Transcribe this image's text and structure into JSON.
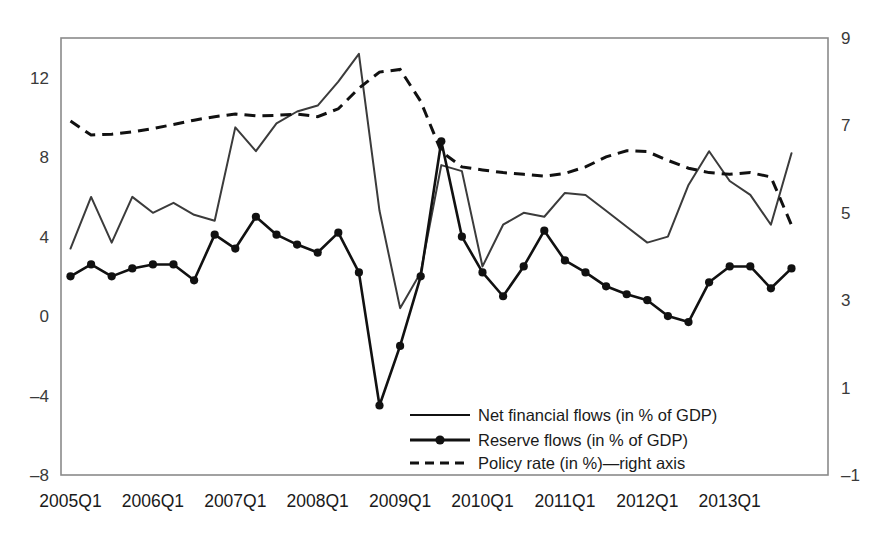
{
  "chart_data": {
    "type": "line",
    "title": "",
    "subtitle": "",
    "xlabel": "",
    "ylabel": "",
    "y2label": "",
    "grid": false,
    "legend_position": "bottom-right-inside",
    "xlim": [
      "2005Q1",
      "2013Q4"
    ],
    "ylim": [
      -8,
      14
    ],
    "y2lim": [
      -1,
      9
    ],
    "yticks": [
      12,
      8,
      4,
      0,
      -4,
      -8
    ],
    "ytick_labels": [
      "12",
      "8",
      "4",
      "0",
      "–4",
      "–8"
    ],
    "y2ticks": [
      9,
      7,
      5,
      3,
      1,
      -1
    ],
    "y2tick_labels": [
      "9",
      "7",
      "5",
      "3",
      "1",
      "–1"
    ],
    "xticks": [
      "2005Q1",
      "2006Q1",
      "2007Q1",
      "2008Q1",
      "2009Q1",
      "2010Q1",
      "2011Q1",
      "2012Q1",
      "2013Q1"
    ],
    "xtick_labels": [
      "2005Q1",
      "2006Q1",
      "2007Q1",
      "2008Q1",
      "2009Q1",
      "2010Q1",
      "2011Q1",
      "2012Q1",
      "2013Q1"
    ],
    "x": [
      "2005Q1",
      "2005Q2",
      "2005Q3",
      "2005Q4",
      "2006Q1",
      "2006Q2",
      "2006Q3",
      "2006Q4",
      "2007Q1",
      "2007Q2",
      "2007Q3",
      "2007Q4",
      "2008Q1",
      "2008Q2",
      "2008Q3",
      "2008Q4",
      "2009Q1",
      "2009Q2",
      "2009Q3",
      "2009Q4",
      "2010Q1",
      "2010Q2",
      "2010Q3",
      "2010Q4",
      "2011Q1",
      "2011Q2",
      "2011Q3",
      "2011Q4",
      "2012Q1",
      "2012Q2",
      "2012Q3",
      "2012Q4",
      "2013Q1",
      "2013Q2",
      "2013Q3",
      "2013Q4"
    ],
    "series": [
      {
        "name": "Net financial flows (in % of GDP)",
        "axis": "left",
        "style": "solid",
        "markers": false,
        "color": "#3b3b3b",
        "values": [
          3.4,
          6.0,
          3.7,
          6.0,
          5.2,
          5.7,
          5.1,
          4.8,
          9.5,
          8.3,
          9.7,
          10.3,
          10.6,
          11.8,
          13.2,
          5.3,
          0.4,
          2.2,
          7.6,
          7.3,
          2.5,
          4.6,
          5.2,
          5.0,
          6.2,
          6.1,
          5.3,
          4.5,
          3.7,
          4.0,
          6.6,
          8.3,
          6.8,
          6.1,
          4.6,
          8.2
        ]
      },
      {
        "name": "Reserve flows (in % of GDP)",
        "axis": "left",
        "style": "solid",
        "markers": true,
        "color": "#111111",
        "values": [
          2.0,
          2.6,
          2.0,
          2.4,
          2.6,
          2.6,
          1.8,
          4.1,
          3.4,
          5.0,
          4.1,
          3.6,
          3.2,
          4.2,
          2.2,
          -4.5,
          -1.5,
          2.0,
          8.8,
          4.0,
          2.2,
          1.0,
          2.5,
          4.3,
          2.8,
          2.2,
          1.5,
          1.1,
          0.8,
          0.0,
          -0.3,
          1.7,
          2.5,
          2.5,
          1.4,
          2.4
        ]
      },
      {
        "name": "Policy rate (in %)—right axis",
        "axis": "right",
        "style": "dashed",
        "markers": false,
        "color": "#111111",
        "values": [
          7.1,
          6.78,
          6.8,
          6.85,
          6.93,
          7.02,
          7.12,
          7.2,
          7.26,
          7.22,
          7.23,
          7.26,
          7.2,
          7.38,
          7.85,
          8.22,
          8.28,
          7.55,
          6.4,
          6.05,
          5.98,
          5.92,
          5.88,
          5.84,
          5.9,
          6.05,
          6.28,
          6.42,
          6.4,
          6.2,
          6.02,
          5.92,
          5.88,
          5.92,
          5.82,
          4.72
        ]
      }
    ],
    "legend": [
      {
        "label": "Net financial flows (in % of GDP)",
        "style": "solid",
        "marker": false
      },
      {
        "label": "Reserve flows (in % of GDP)",
        "style": "solid",
        "marker": true
      },
      {
        "label": "Policy rate (in %)—right axis",
        "style": "dashed",
        "marker": false
      }
    ]
  }
}
